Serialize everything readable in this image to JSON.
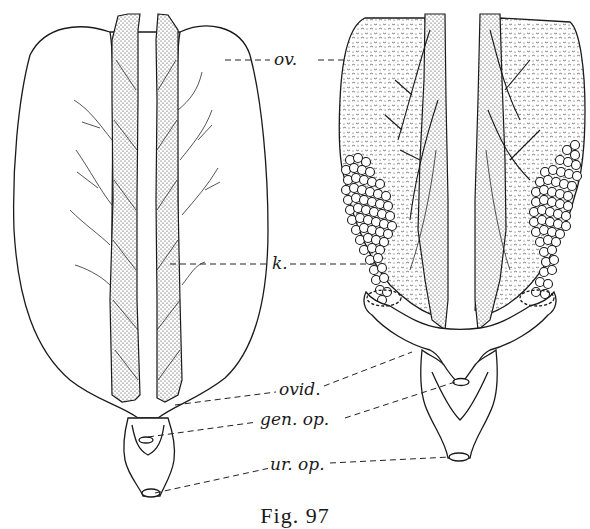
{
  "figure": {
    "caption": "Fig. 97",
    "labels": {
      "ovary": "ov.",
      "kidney": "k.",
      "oviduct": "ovid.",
      "genital_opening": "gen. op.",
      "urinary_opening": "ur. op."
    },
    "colors": {
      "ink": "#1a1a1a",
      "paper": "#ffffff"
    }
  }
}
